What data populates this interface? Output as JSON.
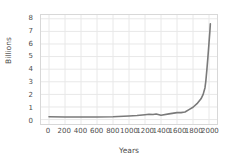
{
  "chart_data": {
    "type": "line",
    "title": "",
    "xlabel": "Years",
    "ylabel": "Billions",
    "xlim": [
      -100,
      2100
    ],
    "ylim": [
      -0.35,
      8.3
    ],
    "grid": true,
    "legend": false,
    "line_color": "#7a7a7a",
    "grid_color": "#e8e8e8",
    "frame_color": "#d8d8d8",
    "text_color": "#4d4d4d",
    "xticks": [
      0,
      200,
      400,
      600,
      800,
      1000,
      1200,
      1400,
      1600,
      1800,
      2000
    ],
    "xticklabels": [
      "0",
      "200",
      "400",
      "600",
      "800",
      "1000",
      "1200",
      "1400",
      "1600",
      "1800",
      "2000"
    ],
    "yticks": [
      0,
      1,
      2,
      3,
      4,
      5,
      6,
      7,
      8
    ],
    "yticklabels": [
      "0",
      "1",
      "2",
      "3",
      "4",
      "5",
      "6",
      "7",
      "8"
    ],
    "series": [
      {
        "name": "World population",
        "x": [
          0,
          200,
          400,
          600,
          800,
          1000,
          1100,
          1200,
          1250,
          1300,
          1340,
          1400,
          1500,
          1600,
          1650,
          1700,
          1750,
          1800,
          1850,
          1900,
          1927,
          1950,
          1960,
          1974,
          1987,
          1999,
          2000,
          2011,
          2017
        ],
        "y": [
          0.23,
          0.21,
          0.2,
          0.21,
          0.22,
          0.29,
          0.32,
          0.39,
          0.42,
          0.4,
          0.44,
          0.35,
          0.45,
          0.55,
          0.55,
          0.6,
          0.79,
          0.98,
          1.26,
          1.65,
          2.0,
          2.53,
          3.03,
          4.0,
          5.0,
          6.0,
          6.09,
          7.0,
          7.6
        ]
      }
    ]
  }
}
